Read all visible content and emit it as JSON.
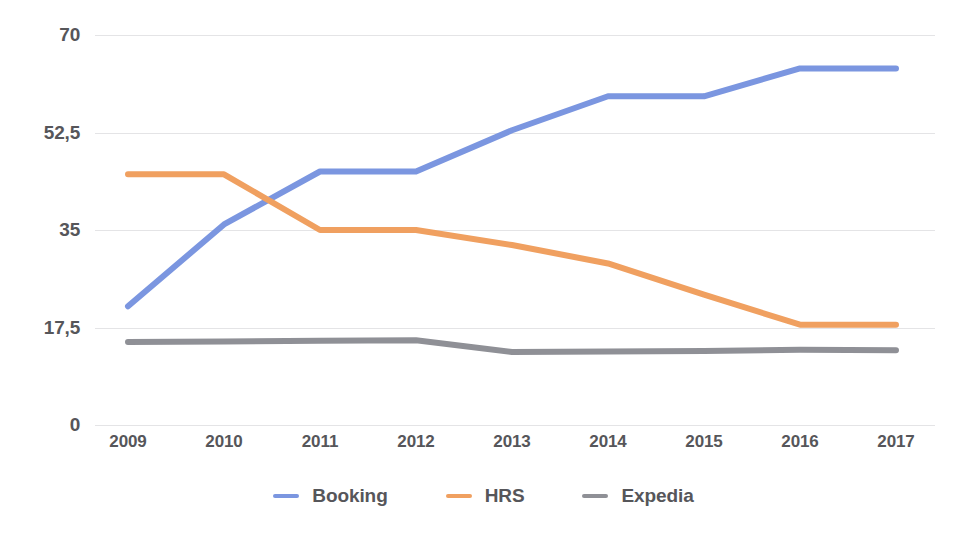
{
  "chart_data": {
    "type": "line",
    "title": "",
    "subtitle": "",
    "xlabel": "",
    "ylabel": "",
    "categories": [
      "2009",
      "2010",
      "2011",
      "2012",
      "2013",
      "2014",
      "2015",
      "2016",
      "2017"
    ],
    "x": [
      2009,
      2010,
      2011,
      2012,
      2013,
      2014,
      2015,
      2016,
      2017
    ],
    "series": [
      {
        "name": "Booking",
        "color": "#7b96e0",
        "values": [
          21.3,
          36.0,
          45.5,
          45.5,
          52.9,
          59.0,
          59.0,
          64.0,
          64.0
        ]
      },
      {
        "name": "HRS",
        "color": "#f0a060",
        "values": [
          45.0,
          45.0,
          35.0,
          35.0,
          32.3,
          29.0,
          23.4,
          18.0,
          18.0
        ]
      },
      {
        "name": "Expedia",
        "color": "#8f9096",
        "values": [
          14.9,
          15.0,
          15.1,
          15.2,
          13.1,
          13.2,
          13.3,
          13.5,
          13.4
        ]
      }
    ],
    "ylim": [
      0,
      70
    ],
    "yticks": [
      0,
      17.5,
      35,
      52.5,
      70
    ],
    "ytick_labels": [
      "0",
      "17,5",
      "35",
      "52,5",
      "70"
    ],
    "grid": true,
    "legend_position": "bottom",
    "annotations": []
  },
  "axes": {
    "y_labels": [
      "70",
      "52,5",
      "35",
      "17,5",
      "0"
    ],
    "x_labels": [
      "2009",
      "2010",
      "2011",
      "2012",
      "2013",
      "2014",
      "2015",
      "2016",
      "2017"
    ]
  },
  "legend": {
    "items": [
      {
        "label": "Booking",
        "color": "#7b96e0"
      },
      {
        "label": "HRS",
        "color": "#f0a060"
      },
      {
        "label": "Expedia",
        "color": "#8f9096"
      }
    ]
  },
  "style": {
    "gridline_color": "#e4e4e6",
    "text_color": "#56565a",
    "background": "#ffffff"
  }
}
